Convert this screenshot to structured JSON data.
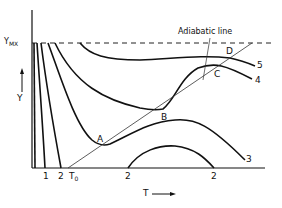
{
  "diagram": {
    "axes": {
      "x_label": "T",
      "x_arrow": "→",
      "y_label": "Y",
      "y_arrow": "↑",
      "y_max_label": "Y",
      "y_max_sub": "MX"
    },
    "adiabatic_label": "Adiabatic line",
    "points": {
      "A": "A",
      "B": "B",
      "C": "C",
      "D": "D"
    },
    "curve_labels": {
      "c1_bottom": "1",
      "c2_bottom_left": "2",
      "t0": "T",
      "t0_sub": "0",
      "c2_bottom_mid": "2",
      "c2_bottom_right": "2",
      "c3": "3",
      "c4": "4",
      "c5": "5"
    },
    "colors": {
      "ink": "#111111",
      "background": "#ffffff"
    }
  }
}
